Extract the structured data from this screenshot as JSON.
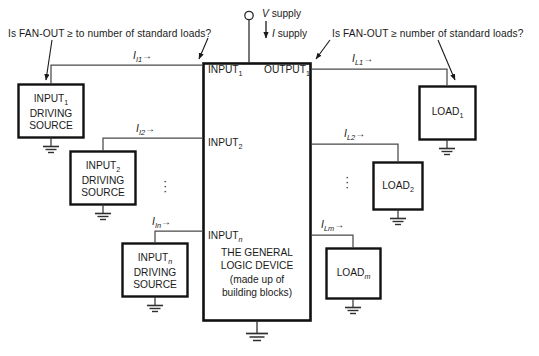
{
  "annotations": {
    "left_question": "Is FAN-OUT ≥ to number of standard loads?",
    "right_question": "Is FAN-OUT ≥ number of standard loads?"
  },
  "supply": {
    "voltage_label": "V supply",
    "current_label": "I supply",
    "voltage_symbol": "V",
    "current_symbol": "I",
    "word": "supply",
    "terminal_icon": "open-circle-terminal"
  },
  "device": {
    "line1": "THE GENERAL",
    "line2": "LOGIC DEVICE",
    "line3": "(made up of",
    "line4": "building blocks)",
    "ground_icon": "ground-symbol"
  },
  "ports": {
    "inputs": [
      {
        "name": "INPUT",
        "sub": "1",
        "sub_italic": false
      },
      {
        "name": "INPUT",
        "sub": "2",
        "sub_italic": false
      },
      {
        "name": "INPUT",
        "sub": "n",
        "sub_italic": true
      }
    ],
    "outputs": [
      {
        "name": "OUTPUT",
        "sub": "1",
        "sub_italic": false
      }
    ]
  },
  "input_currents": [
    {
      "symbol": "I",
      "sub": "I1",
      "arrow": "→"
    },
    {
      "symbol": "I",
      "sub": "I2",
      "arrow": "→"
    },
    {
      "symbol": "I",
      "sub": "In",
      "arrow": "→"
    }
  ],
  "load_currents": [
    {
      "symbol": "I",
      "sub": "L1",
      "arrow": "→"
    },
    {
      "symbol": "I",
      "sub": "L2",
      "arrow": "→"
    },
    {
      "symbol": "I",
      "sub": "Lm",
      "arrow": "→"
    }
  ],
  "driving_sources": [
    {
      "l1": "INPUT",
      "sub": "1",
      "sub_italic": false,
      "l2": "DRIVING",
      "l3": "SOURCE"
    },
    {
      "l1": "INPUT",
      "sub": "2",
      "sub_italic": false,
      "l2": "DRIVING",
      "l3": "SOURCE"
    },
    {
      "l1": "INPUT",
      "sub": "n",
      "sub_italic": true,
      "l2": "DRIVING",
      "l3": "SOURCE"
    }
  ],
  "loads": [
    {
      "name": "LOAD",
      "sub": "1",
      "sub_italic": false
    },
    {
      "name": "LOAD",
      "sub": "2",
      "sub_italic": false
    },
    {
      "name": "LOAD",
      "sub": "m",
      "sub_italic": true
    }
  ],
  "ellipsis": {
    "glyph": "·",
    "left_label": "vertical-ellipsis-inputs",
    "right_label": "vertical-ellipsis-loads"
  },
  "colors": {
    "ink": "#1a1a1a",
    "wire": "#3a3a3a",
    "box_stroke": "#111111",
    "background": "#ffffff"
  }
}
